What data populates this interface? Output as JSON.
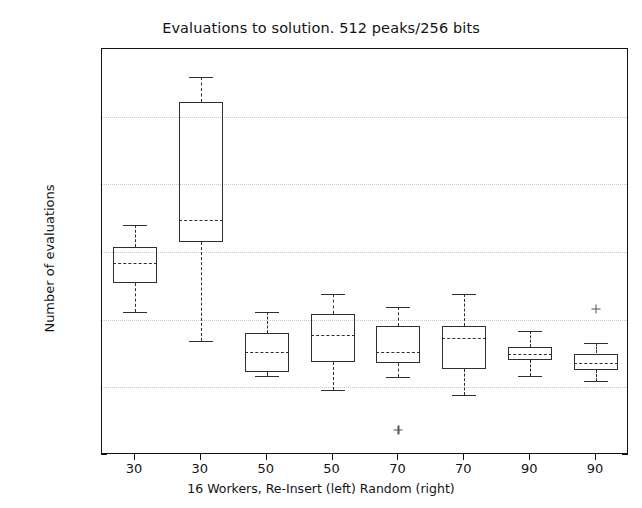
{
  "chart_data": {
    "type": "box",
    "title": "Evaluations to solution. 512 peaks/256 bits",
    "xlabel": "16 Workers, Re-Insert (left)   Random (right)",
    "ylabel": "Number of evaluations",
    "ylim": [
      0,
      600000
    ],
    "ytick_labels": [
      "0",
      "100000",
      "200000",
      "300000",
      "400000",
      "500000",
      "600000"
    ],
    "ytick_values": [
      0,
      100000,
      200000,
      300000,
      400000,
      500000,
      600000
    ],
    "categories": [
      "30",
      "30",
      "50",
      "50",
      "70",
      "70",
      "90",
      "90"
    ],
    "grid": true,
    "legend": "none",
    "boxes": [
      {
        "label": "30",
        "whisker_low": 212000,
        "q1": 254000,
        "median": 284000,
        "q3": 308000,
        "whisker_high": 340000,
        "outliers": []
      },
      {
        "label": "30",
        "whisker_low": 168000,
        "q1": 315000,
        "median": 348000,
        "q3": 522000,
        "whisker_high": 558000,
        "outliers": []
      },
      {
        "label": "50",
        "whisker_low": 117000,
        "q1": 122000,
        "median": 152000,
        "q3": 180000,
        "whisker_high": 211000,
        "outliers": []
      },
      {
        "label": "50",
        "whisker_low": 96000,
        "q1": 138000,
        "median": 178000,
        "q3": 208000,
        "whisker_high": 238000,
        "outliers": []
      },
      {
        "label": "70",
        "whisker_low": 116000,
        "q1": 136000,
        "median": 152000,
        "q3": 190000,
        "whisker_high": 219000,
        "outliers": [
          37000
        ]
      },
      {
        "label": "70",
        "whisker_low": 88000,
        "q1": 127000,
        "median": 173000,
        "q3": 190000,
        "whisker_high": 238000,
        "outliers": []
      },
      {
        "label": "90",
        "whisker_low": 117000,
        "q1": 140000,
        "median": 150000,
        "q3": 160000,
        "whisker_high": 183000,
        "outliers": []
      },
      {
        "label": "90",
        "whisker_low": 110000,
        "q1": 125000,
        "median": 136000,
        "q3": 150000,
        "whisker_high": 166000,
        "outliers": [
          216000
        ]
      }
    ]
  }
}
